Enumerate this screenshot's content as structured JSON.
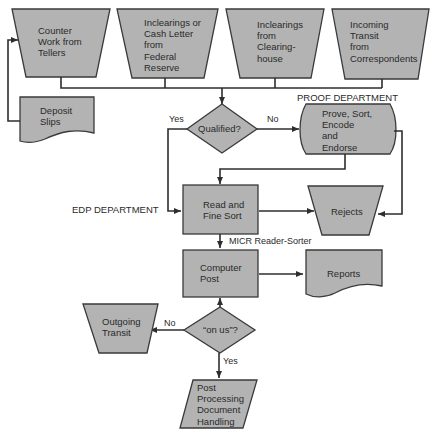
{
  "diagram": {
    "type": "flowchart",
    "colors": {
      "shape_fill": "#b3b3b3",
      "line": "#2e2e2e",
      "text": "#2a2a2a",
      "background": "#ffffff"
    },
    "inputs": [
      {
        "id": "counter",
        "lines": [
          "Counter",
          "Work from",
          "Tellers"
        ]
      },
      {
        "id": "fed",
        "lines": [
          "Inclearings or",
          "Cash Letter",
          "from",
          "Federal",
          "Reserve"
        ]
      },
      {
        "id": "clearinghouse",
        "lines": [
          "Inclearings",
          "from",
          "Clearing-",
          "house"
        ]
      },
      {
        "id": "transit",
        "lines": [
          "Incoming",
          "Transit",
          "from",
          "Correspondents"
        ]
      }
    ],
    "deposit_slips": {
      "lines": [
        "Deposit",
        "Slips"
      ]
    },
    "qualified": {
      "label": "Qualified?",
      "yes": "Yes",
      "no": "No"
    },
    "proof_department_label": "PROOF DEPARTMENT",
    "prove": {
      "lines": [
        "Prove, Sort,",
        "Encode",
        "and",
        "Endorse"
      ]
    },
    "edp_department_label": "EDP DEPARTMENT",
    "read_sort": {
      "lines": [
        "Read and",
        "Fine Sort"
      ]
    },
    "rejects": {
      "label": "Rejects"
    },
    "micr_label": "MICR Reader-Sorter",
    "computer_post": {
      "lines": [
        "Computer",
        "Post"
      ]
    },
    "reports": {
      "label": "Reports"
    },
    "on_us": {
      "label": "“on us”?",
      "yes": "Yes",
      "no": "No"
    },
    "outgoing": {
      "lines": [
        "Outgoing",
        "Transit"
      ]
    },
    "post_processing": {
      "lines": [
        "Post",
        "Processing",
        "Document",
        "Handling"
      ]
    }
  }
}
